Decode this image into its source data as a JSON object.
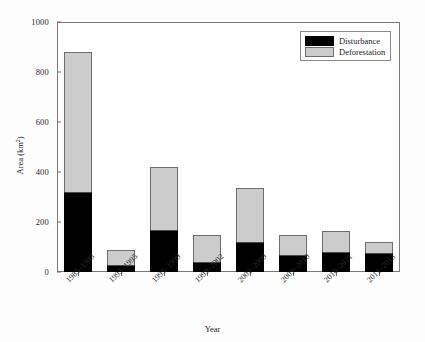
{
  "chart_data": {
    "type": "bar",
    "title": "",
    "subtitle": "",
    "xlabel": "Year",
    "ylabel": "Area (km2)",
    "ylabel_base": "Area (km",
    "ylabel_exp": "2",
    "ylabel_close": ")",
    "stacked": true,
    "grid": false,
    "legend_position": "top-right",
    "ylim": [
      0,
      1000
    ],
    "yticks": [
      0,
      200,
      400,
      600,
      800,
      1000
    ],
    "ytick_labels": [
      "0",
      "200",
      "400",
      "600",
      "800",
      "1000"
    ],
    "categories": [
      "1985–1993",
      "1993–1995",
      "1995–1999",
      "1999–2002",
      "2002–2009",
      "2009–2010",
      "2010–2011",
      "2011–2013"
    ],
    "series": [
      {
        "name": "Disturbance",
        "color": "#000000",
        "values": [
          320,
          30,
          170,
          42,
          120,
          68,
          82,
          78
        ]
      },
      {
        "name": "Deforestation",
        "color": "#cccccc",
        "values": [
          560,
          58,
          250,
          106,
          215,
          80,
          83,
          42
        ]
      }
    ],
    "stack_totals": [
      880,
      88,
      420,
      148,
      335,
      148,
      165,
      120
    ]
  },
  "legend": {
    "items": [
      {
        "label": "Disturbance",
        "color": "#000000"
      },
      {
        "label": "Deforestation",
        "color": "#cccccc"
      }
    ]
  },
  "axes": {
    "x_title": "Year",
    "y_title_base": "Area (km",
    "y_title_exp": "2",
    "y_title_close": ")"
  }
}
